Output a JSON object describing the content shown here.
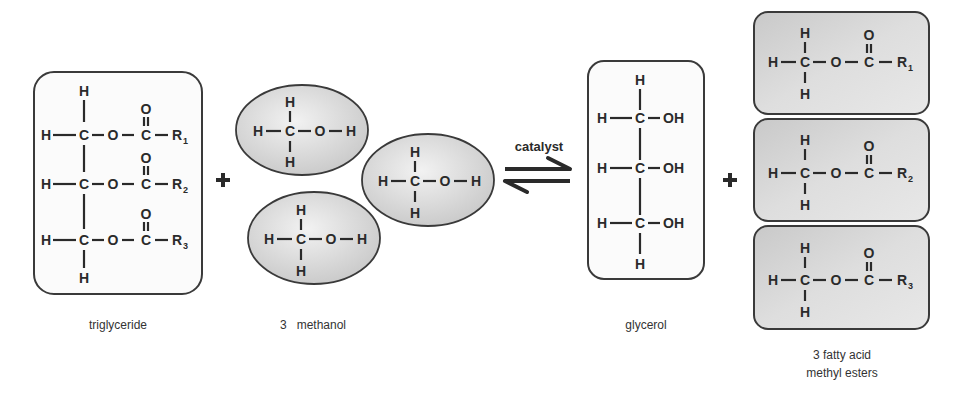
{
  "reactants": {
    "triglyceride": {
      "label": "triglyceride",
      "atoms": {
        "H": "H",
        "C": "C",
        "O": "O",
        "R": "R"
      },
      "r_subscripts": [
        "1",
        "2",
        "3"
      ]
    },
    "methanol": {
      "label": "3   methanol",
      "coefficient": "3",
      "atoms": {
        "H": "H",
        "C": "C",
        "O": "O"
      }
    }
  },
  "plus_sign": "+",
  "arrow": {
    "label": "catalyst",
    "type": "equilibrium"
  },
  "products": {
    "glycerol": {
      "label": "glycerol",
      "atoms": {
        "H": "H",
        "C": "C",
        "OH": "OH"
      }
    },
    "esters": {
      "label_line1": "3 fatty acid",
      "label_line2": "methyl esters",
      "atoms": {
        "H": "H",
        "C": "C",
        "O": "O",
        "R": "R"
      },
      "r_subscripts": [
        "1",
        "2",
        "3"
      ]
    }
  },
  "colors": {
    "line": "#2a2a2a",
    "fill_gray": "#d4d4d4",
    "fill_light": "#fafafa"
  }
}
